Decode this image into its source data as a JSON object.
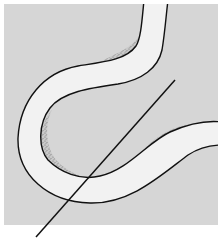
{
  "figure": {
    "colors": {
      "page_background": "#ffffff",
      "field": "#d6d6d6",
      "channel": "#f1f1f1",
      "stipple": "#6e6e6e",
      "outline": "#111111"
    },
    "field_rect": {
      "x": 4,
      "y": 4,
      "width": 214,
      "height": 221
    },
    "section_line": {
      "x1": 36,
      "y1": 237,
      "x2": 175,
      "y2": 80
    }
  }
}
